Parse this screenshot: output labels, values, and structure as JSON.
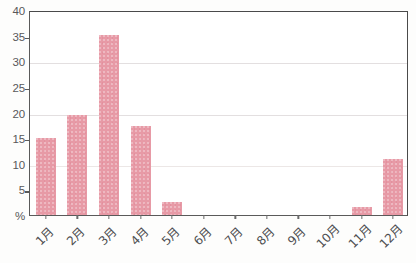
{
  "chart_data": {
    "type": "bar",
    "title": "",
    "subtitle": "",
    "xlabel": "",
    "ylabel": "%",
    "categories": [
      "1月",
      "2月",
      "3月",
      "4月",
      "5月",
      "6月",
      "7月",
      "8月",
      "9月",
      "10月",
      "11月",
      "12月"
    ],
    "values": [
      15.0,
      19.5,
      35.2,
      17.3,
      2.5,
      0,
      0,
      0,
      0,
      0,
      1.5,
      11.0
    ],
    "series": [
      {
        "name": "",
        "values": [
          15.0,
          19.5,
          35.2,
          17.3,
          2.5,
          0,
          0,
          0,
          0,
          0,
          1.5,
          11.0
        ]
      }
    ],
    "ylim": [
      0,
      40
    ],
    "yticks": [
      0,
      5,
      10,
      15,
      20,
      25,
      30,
      35,
      40
    ],
    "ytick_labels": [
      "%",
      "5",
      "10",
      "15",
      "20",
      "25",
      "30",
      "35",
      "40"
    ],
    "gridlines": [
      10,
      20,
      30
    ],
    "tickmarks": [
      5,
      15,
      25,
      35
    ],
    "grid": true,
    "legend": false,
    "legend_position": "none",
    "bar_color": "#e79aa6",
    "axis_color": "#5a5a5a",
    "grid_color": "#e3dfe0",
    "background_color": "#ffffff"
  }
}
